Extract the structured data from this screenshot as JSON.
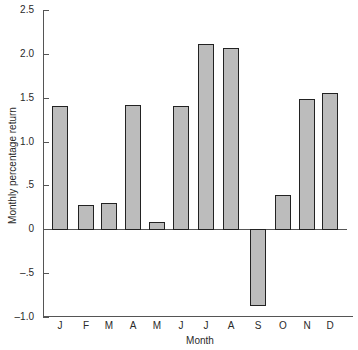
{
  "chart_data": {
    "type": "bar",
    "title": "",
    "xlabel": "Month",
    "ylabel": "Monthly percentage return",
    "categories": [
      "J",
      "F",
      "M",
      "A",
      "M",
      "J",
      "J",
      "A",
      "S",
      "O",
      "N",
      "D"
    ],
    "values": [
      1.41,
      0.27,
      0.3,
      1.42,
      0.08,
      1.41,
      2.12,
      2.07,
      -0.87,
      0.39,
      1.49,
      1.55
    ],
    "ylim": [
      -1.0,
      2.5
    ],
    "yticks": [
      2.5,
      2.0,
      1.5,
      1.0,
      0.5,
      0,
      -0.5,
      -1.0
    ],
    "ytick_labels": [
      "2.5",
      "2.0",
      "1.5",
      "1.0",
      ".5",
      "0",
      "–.5",
      "–1.0"
    ],
    "grid": false,
    "legend": null,
    "bar_color": "#bcbcbc",
    "edge_color": "#222222"
  }
}
